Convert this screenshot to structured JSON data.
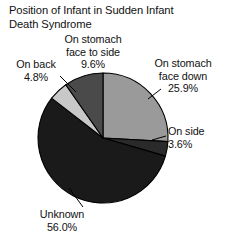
{
  "chart_data": {
    "type": "pie",
    "title": "Position of Infant in Sudden Infant\nDeath Syndrome",
    "xlabel": "",
    "ylabel": "",
    "legend_position": "none",
    "grid": false,
    "start_angle_deg": 0,
    "direction": "clockwise",
    "categories": [
      "On stomach face down",
      "On side",
      "Unknown",
      "On back",
      "On stomach face to side"
    ],
    "values": [
      25.9,
      3.6,
      56.0,
      4.8,
      9.6
    ],
    "value_unit": "%",
    "slices": [
      {
        "label": "On stomach\nface down",
        "value_text": "25.9%",
        "value": 25.9,
        "color": "#9a9a9a",
        "start_deg": 0,
        "end_deg": 93.24
      },
      {
        "label": "On side",
        "value_text": "3.6%",
        "value": 3.6,
        "color": "#2a2a2a",
        "start_deg": 93.24,
        "end_deg": 106.2
      },
      {
        "label": "Unknown",
        "value_text": "56.0%",
        "value": 56.0,
        "color": "#1a1a1a",
        "start_deg": 106.2,
        "end_deg": 307.8
      },
      {
        "label": "On back",
        "value_text": "4.8%",
        "value": 4.8,
        "color": "#c8c8c8",
        "start_deg": 307.8,
        "end_deg": 325.08
      },
      {
        "label": "On stomach\nface to side",
        "value_text": "9.6%",
        "value": 9.6,
        "color": "#4a4a4a",
        "start_deg": 325.08,
        "end_deg": 360
      }
    ],
    "annotations": [
      {
        "id": "stomach-side",
        "text": "On stomach\nface to side\n9.6%"
      },
      {
        "id": "stomach-down",
        "text": "On stomach\nface down\n25.9%"
      },
      {
        "id": "on-back",
        "text": "On back\n4.8%"
      },
      {
        "id": "on-side",
        "text": "On side\n3.6%"
      },
      {
        "id": "unknown",
        "text": "Unknown\n56.0%"
      }
    ],
    "outline_color": "#000000"
  }
}
